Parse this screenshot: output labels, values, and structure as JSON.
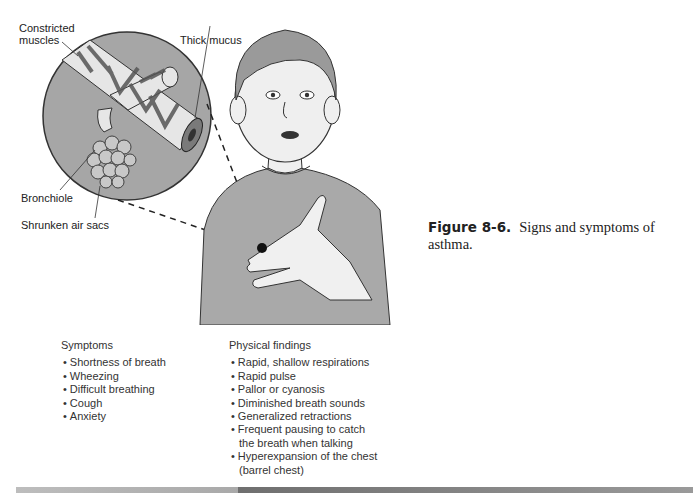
{
  "figure": {
    "number": "Figure 8-6.",
    "caption": "Signs and symptoms of asthma."
  },
  "illustration": {
    "labels": {
      "constricted_muscles": "Constricted\nmuscles",
      "constricted_line1": "Constricted",
      "constricted_line2": "muscles",
      "thick_mucus": "Thick mucus",
      "bronchiole": "Bronchiole",
      "shrunken_air_sacs": "Shrunken air sacs"
    }
  },
  "symptoms": {
    "heading": "Symptoms",
    "items": [
      "Shortness of breath",
      "Wheezing",
      "Difficult breathing",
      "Cough",
      "Anxiety"
    ]
  },
  "physical_findings": {
    "heading": "Physical findings",
    "items": [
      "Rapid, shallow respirations",
      "Rapid pulse",
      "Pallor or cyanosis",
      "Diminished breath sounds",
      "Generalized retractions",
      "Frequent pausing to catch the breath when talking",
      "Hyperexpansion of the chest (barrel chest)"
    ]
  }
}
